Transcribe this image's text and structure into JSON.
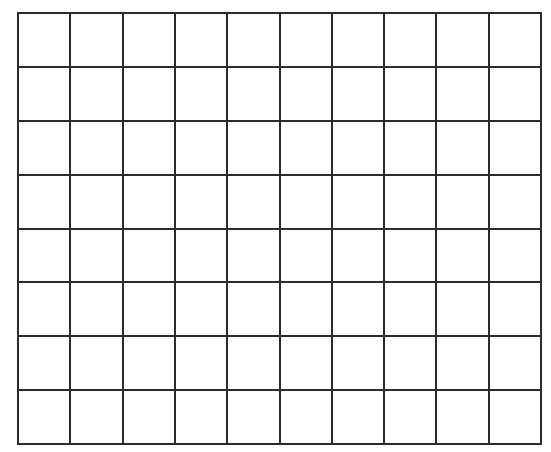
{
  "grid": {
    "columns": 10,
    "rows": 8,
    "left": 18,
    "top": 13,
    "width": 523,
    "height": 431,
    "line_color": "#2b2b2b",
    "line_width": 2,
    "background": "#ffffff"
  }
}
